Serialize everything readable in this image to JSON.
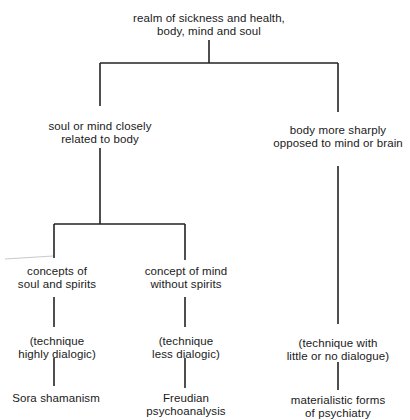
{
  "diagram": {
    "type": "tree",
    "root": {
      "id": "root",
      "lines": [
        "realm of sickness and health,",
        "body, mind and soul"
      ]
    },
    "nodes": {
      "soul_mind_body": {
        "lines": [
          "soul or mind closely",
          "related to body"
        ]
      },
      "body_opposed": {
        "lines": [
          "body more sharply",
          "opposed to mind or brain"
        ]
      },
      "concepts_soul_spirits": {
        "lines": [
          "concepts of",
          "soul and spirits"
        ]
      },
      "concept_mind_no_spirits": {
        "lines": [
          "concept of mind",
          "without spirits"
        ]
      },
      "technique_highly": {
        "lines": [
          "(technique",
          "highly dialogic)"
        ]
      },
      "technique_less": {
        "lines": [
          "(technique",
          "less dialogic)"
        ]
      },
      "technique_little": {
        "lines": [
          "(technique with",
          "little or no dialogue)"
        ]
      },
      "sora": {
        "lines": [
          "Sora shamanism"
        ]
      },
      "freudian": {
        "lines": [
          "Freudian",
          "psychoanalysis"
        ]
      },
      "materialistic": {
        "lines": [
          "materialistic forms",
          "of psychiatry"
        ]
      }
    },
    "edges": [
      [
        "root",
        "soul_mind_body"
      ],
      [
        "root",
        "body_opposed"
      ],
      [
        "soul_mind_body",
        "concepts_soul_spirits"
      ],
      [
        "soul_mind_body",
        "concept_mind_no_spirits"
      ],
      [
        "concepts_soul_spirits",
        "technique_highly"
      ],
      [
        "concept_mind_no_spirits",
        "technique_less"
      ],
      [
        "body_opposed",
        "technique_little"
      ],
      [
        "technique_highly",
        "sora"
      ],
      [
        "technique_less",
        "freudian"
      ],
      [
        "technique_little",
        "materialistic"
      ]
    ],
    "line_color": "#222222"
  }
}
